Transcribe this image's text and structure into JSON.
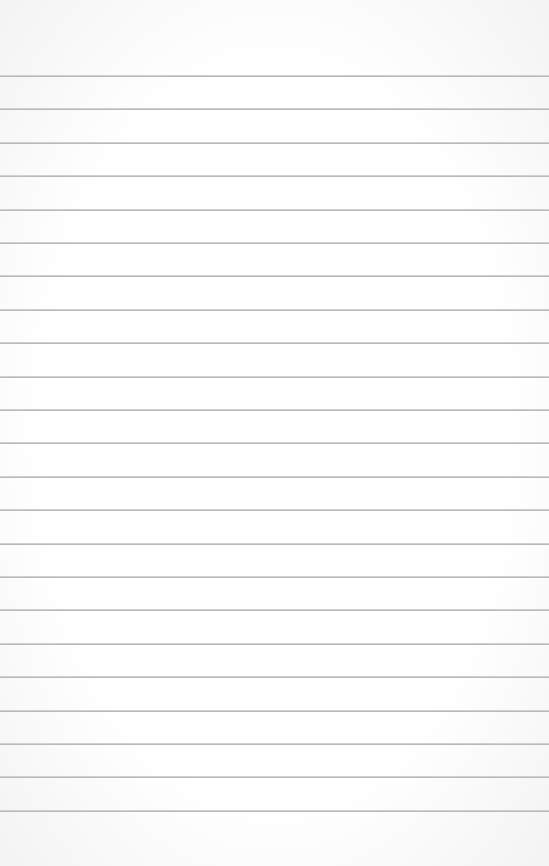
{
  "paper": {
    "type": "ruled-paper",
    "background_color": "#ffffff",
    "line_color": "#b9b9b9",
    "first_line_y": 75,
    "line_spacing": 33.4,
    "line_count": 23
  }
}
